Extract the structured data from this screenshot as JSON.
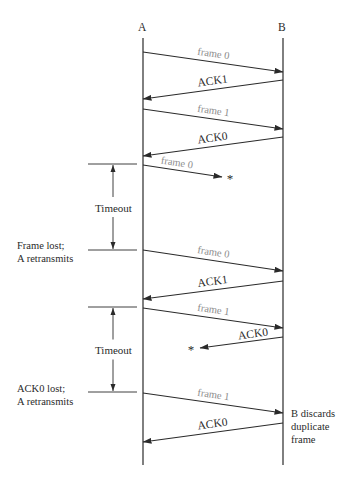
{
  "diagram": {
    "type": "sequence",
    "title": "",
    "stations": [
      {
        "id": "A",
        "label": "A",
        "x": 143
      },
      {
        "id": "B",
        "label": "B",
        "x": 283
      }
    ],
    "colors": {
      "line": "#2a2a2a",
      "frame_label": "#8c8c8c",
      "ack_label": "#2a2a2a",
      "text": "#2a2a2a"
    },
    "messages": [
      {
        "label": "frame 0",
        "kind": "frame",
        "from": "A",
        "to": "B",
        "y1": 52,
        "y2": 72,
        "lost": false
      },
      {
        "label": "ACK1",
        "kind": "ack",
        "from": "B",
        "to": "A",
        "y1": 80,
        "y2": 99,
        "lost": false
      },
      {
        "label": "frame 1",
        "kind": "frame",
        "from": "A",
        "to": "B",
        "y1": 109,
        "y2": 129,
        "lost": false
      },
      {
        "label": "ACK0",
        "kind": "ack",
        "from": "B",
        "to": "A",
        "y1": 137,
        "y2": 156,
        "lost": false
      },
      {
        "label": "frame 0",
        "kind": "frame",
        "from": "A",
        "to": "B",
        "y1": 165,
        "y2": 177,
        "lost": true,
        "end_x": 222,
        "loss_marker": "*"
      },
      {
        "label": "frame 0",
        "kind": "frame",
        "from": "A",
        "to": "B",
        "y1": 250,
        "y2": 271,
        "lost": false
      },
      {
        "label": "ACK1",
        "kind": "ack",
        "from": "B",
        "to": "A",
        "y1": 281,
        "y2": 299,
        "lost": false
      },
      {
        "label": "frame 1",
        "kind": "frame",
        "from": "A",
        "to": "B",
        "y1": 308,
        "y2": 328,
        "lost": false
      },
      {
        "label": "ACK0",
        "kind": "ack",
        "from": "B",
        "to": "A",
        "y1": 337,
        "y2": 348,
        "lost": true,
        "end_x": 200,
        "loss_marker": "*"
      },
      {
        "label": "frame 1",
        "kind": "frame",
        "from": "A",
        "to": "B",
        "y1": 393,
        "y2": 413,
        "lost": false
      },
      {
        "label": "ACK0",
        "kind": "ack",
        "from": "B",
        "to": "A",
        "y1": 423,
        "y2": 442,
        "lost": false
      }
    ],
    "timeouts": [
      {
        "label": "Timeout",
        "y_start": 164,
        "y_end": 250
      },
      {
        "label": "Timeout",
        "y_start": 307,
        "y_end": 392
      }
    ],
    "annotations": {
      "frame_lost": {
        "line1": "Frame lost;",
        "line2": "A retransmits"
      },
      "ack_lost": {
        "line1": "ACK0 lost;",
        "line2": "A retransmits"
      },
      "b_discards": {
        "line1": "B discards",
        "line2": "duplicate",
        "line3": "frame"
      }
    }
  }
}
